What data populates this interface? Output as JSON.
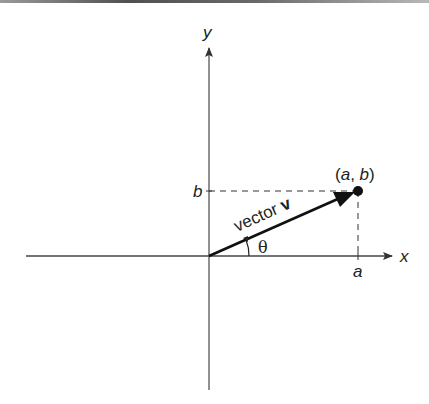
{
  "diagram": {
    "axes": {
      "x_label": "x",
      "y_label": "y"
    },
    "ticks": {
      "x_tick_label": "a",
      "y_tick_label": "b"
    },
    "vector": {
      "label_prefix": "vector ",
      "label_name": "v",
      "angle_label": "θ",
      "from": [
        0,
        0
      ],
      "to": [
        "a",
        "b"
      ]
    },
    "point": {
      "label": "(a, b)",
      "label_open": "(",
      "label_a": "a",
      "label_sep": ", ",
      "label_b": "b",
      "label_close": ")"
    },
    "colors": {
      "ink": "#222222",
      "axis": "#444444",
      "border": "#777777"
    }
  }
}
